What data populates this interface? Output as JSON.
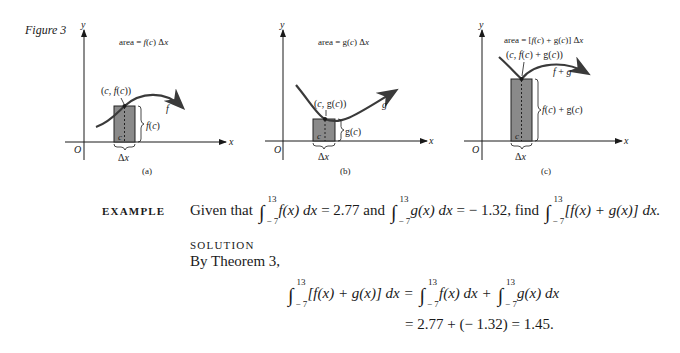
{
  "figure": {
    "label": "Figure 3",
    "panels": [
      {
        "id": "a",
        "caption": "(a)",
        "area_label": "area = f(c) Δx",
        "point_label": "(c, f(c))",
        "height_label": "f(c)",
        "curve_label": "f",
        "c_label": "c",
        "dx_label": "Δx",
        "y_axis": "y",
        "x_axis": "x",
        "origin": "O"
      },
      {
        "id": "b",
        "caption": "(b)",
        "area_label": "area = g(c) Δx",
        "point_label": "(c, g(c))",
        "height_label": "g(c)",
        "curve_label": "g",
        "c_label": "c",
        "dx_label": "Δx",
        "y_axis": "y",
        "x_axis": "x",
        "origin": "O"
      },
      {
        "id": "c",
        "caption": "(c)",
        "area_label": "area = [f(c) + g(c)] Δx",
        "point_label": "(c, f(c) + g(c))",
        "height_label": "f(c) + g(c)",
        "curve_label": "f + g",
        "c_label": "c",
        "dx_label": "Δx",
        "y_axis": "y",
        "x_axis": "x",
        "origin": "O"
      }
    ],
    "colors": {
      "rect_fill": "#8a8a8a",
      "curve": "#3a3a3a",
      "ink": "#1a1a1a"
    }
  },
  "example": {
    "heading": "EXAMPLE",
    "given_prefix": "Given that",
    "upper": "13",
    "lower": "− 7",
    "integrand_f": "f(x) dx",
    "f_value": "= 2.77 and",
    "integrand_g": "g(x) dx",
    "g_value": "= − 1.32, find",
    "integrand_sum": "[f(x) + g(x)] dx."
  },
  "solution": {
    "heading": "SOLUTION",
    "intro": "By Theorem 3,",
    "line1_lhs": "[f(x) + g(x)] dx =",
    "line1_term1": "f(x) dx +",
    "line1_term2": "g(x) dx",
    "line2": "= 2.77 + (− 1.32) = 1.45."
  }
}
